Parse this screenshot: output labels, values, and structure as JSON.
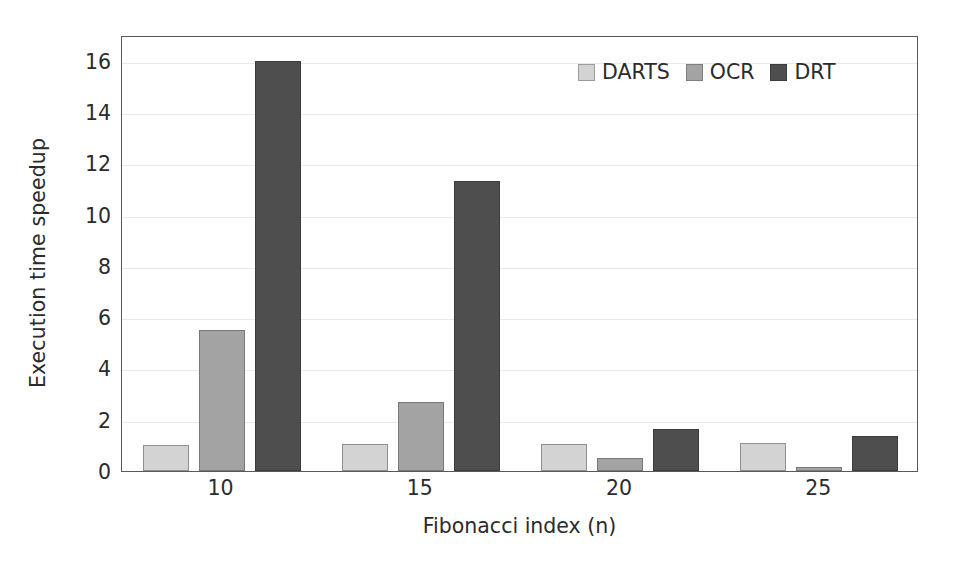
{
  "chart_data": {
    "type": "bar",
    "title": "",
    "xlabel": "Fibonacci index (n)",
    "ylabel": "Execution time speedup",
    "categories": [
      "10",
      "15",
      "20",
      "25"
    ],
    "series": [
      {
        "name": "DARTS",
        "color": "#d3d3d3",
        "values": [
          1.0,
          1.05,
          1.05,
          1.1
        ]
      },
      {
        "name": "OCR",
        "color": "#a3a3a3",
        "values": [
          5.5,
          2.7,
          0.5,
          0.15
        ]
      },
      {
        "name": "DRT",
        "color": "#4e4e4e",
        "values": [
          16.0,
          11.3,
          1.65,
          1.35
        ]
      }
    ],
    "ylim": [
      0,
      17
    ],
    "yticks": [
      0,
      2,
      4,
      6,
      8,
      10,
      12,
      14,
      16
    ],
    "ytick_labels": [
      "0",
      "2",
      "4",
      "6",
      "8",
      "10",
      "12",
      "14",
      "16"
    ],
    "grid": true,
    "grid_axis": "y",
    "legend_position": "top-right",
    "frame": true
  },
  "axes": {
    "y_title": "Execution time speedup",
    "x_title": "Fibonacci index (n)"
  },
  "legend": {
    "entries": [
      {
        "label": "DARTS",
        "swatch": "series-darts"
      },
      {
        "label": "OCR",
        "swatch": "series-ocr"
      },
      {
        "label": "DRT",
        "swatch": "series-drt"
      }
    ]
  },
  "colors": {
    "darts": "#d3d3d3",
    "ocr": "#a3a3a3",
    "drt": "#4e4e4e",
    "frame": "#59595b",
    "grid": "#e9e9ea",
    "text": "#2b2b2b",
    "background": "#ffffff"
  }
}
